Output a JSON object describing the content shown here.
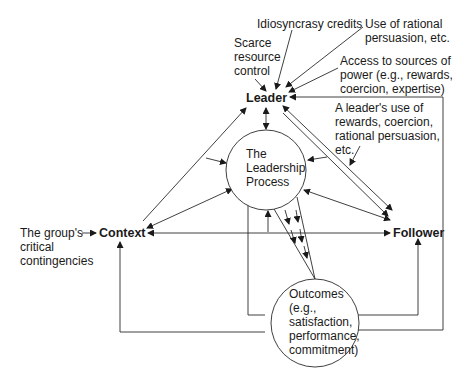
{
  "diagram": {
    "nodes": {
      "leader": "Leader",
      "context": "Context",
      "follower": "Follower",
      "process": [
        "The",
        "Leadership",
        "Process"
      ],
      "outcomes": [
        "Outcomes",
        "(e.g.,",
        "satisfaction,",
        "performance,",
        "commitment)"
      ]
    },
    "inputs": {
      "scarce": [
        "Scarce",
        "resource",
        "control"
      ],
      "idiosyncrasy": "Idiosyncrasy credits",
      "rational": [
        "Use of rational",
        "persuasion, etc."
      ],
      "power": [
        "Access to sources of",
        "power (e.g., rewards,",
        "coercion, expertise)"
      ],
      "leader_use": [
        "A leader's use of",
        "rewards, coercion,",
        "rational persuasion,",
        "etc."
      ],
      "group": [
        "The group's",
        "critical",
        "contingencies"
      ]
    }
  }
}
